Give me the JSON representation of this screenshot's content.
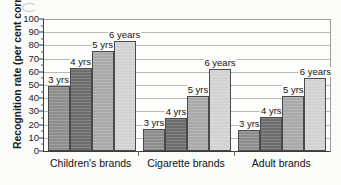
{
  "chart_data": {
    "type": "bar",
    "title": "",
    "xlabel": "",
    "ylabel": "Recognition rate (per cent correct)",
    "ylim": [
      0,
      100
    ],
    "ytick_step": 10,
    "yticks": [
      "0",
      "10",
      "20",
      "30",
      "40",
      "50",
      "60",
      "70",
      "80",
      "90",
      "100"
    ],
    "grid": true,
    "grid_axis": "y",
    "legend": "none",
    "legend_position": "data-labels-above-bars",
    "categories": [
      "Children's brands",
      "Cigarette brands",
      "Adult brands"
    ],
    "series": [
      {
        "name": "3 yrs",
        "label": "3 yrs",
        "color": "#8e8e8e",
        "values": [
          49,
          17,
          16
        ]
      },
      {
        "name": "4 yrs",
        "label": "4 yrs",
        "color": "#6d6d6d",
        "values": [
          63,
          25,
          26
        ]
      },
      {
        "name": "5 yrs",
        "label": "5 yrs",
        "color": "#a9a9a9",
        "values": [
          76,
          42,
          42
        ]
      },
      {
        "name": "6 years",
        "label": "6 years",
        "color": "#d2d2d2",
        "values": [
          83,
          62,
          55
        ]
      }
    ],
    "annotations": [
      {
        "group": "Children's brands",
        "series": "3 yrs",
        "text": "3 yrs",
        "value": 49
      },
      {
        "group": "Children's brands",
        "series": "4 yrs",
        "text": "4 yrs",
        "value": 63
      },
      {
        "group": "Children's brands",
        "series": "5 yrs",
        "text": "5 yrs",
        "value": 76
      },
      {
        "group": "Children's brands",
        "series": "6 years",
        "text": "6 years",
        "value": 83
      },
      {
        "group": "Cigarette brands",
        "series": "3 yrs",
        "text": "3 yrs",
        "value": 17
      },
      {
        "group": "Cigarette brands",
        "series": "4 yrs",
        "text": "4 yrs",
        "value": 25
      },
      {
        "group": "Cigarette brands",
        "series": "5 yrs",
        "text": "5 yrs",
        "value": 42
      },
      {
        "group": "Cigarette brands",
        "series": "6 years",
        "text": "6 years",
        "value": 62
      },
      {
        "group": "Adult brands",
        "series": "3 yrs",
        "text": "3 yrs",
        "value": 16
      },
      {
        "group": "Adult brands",
        "series": "4 yrs",
        "text": "4 yrs",
        "value": 26
      },
      {
        "group": "Adult brands",
        "series": "5 yrs",
        "text": "5 yrs",
        "value": 42
      },
      {
        "group": "Adult brands",
        "series": "6 years",
        "text": "6 years",
        "value": 55
      }
    ]
  },
  "style": {
    "axis_color": "#3b3b3b",
    "grid_color": "#b9b9b9",
    "text_color": "#141414",
    "plot_background": "#fdfdfc",
    "page_background": "#fbfbfa"
  }
}
